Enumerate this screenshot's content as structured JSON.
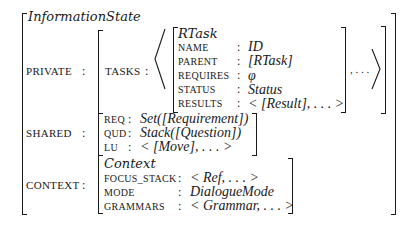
{
  "diagram": {
    "title": "InformationState",
    "private": {
      "label": "PRIVATE",
      "colon": ":",
      "tasks": {
        "label": "TASKS",
        "colon": ":",
        "rtask": {
          "type": "RTask",
          "fields": [
            {
              "label": "NAME",
              "colon": ":",
              "value": "ID"
            },
            {
              "label": "PARENT",
              "colon": ":",
              "value": "[RTask]"
            },
            {
              "label": "REQUIRES",
              "colon": ":",
              "value": "φ"
            },
            {
              "label": "STATUS",
              "colon": ":",
              "value": "Status"
            },
            {
              "label": "RESULTS",
              "colon": ":",
              "value": "< [Result], . . . >"
            }
          ]
        },
        "ellipsis": ", . . ."
      }
    },
    "shared": {
      "label": "SHARED",
      "colon": ":",
      "fields": [
        {
          "label": "REQ",
          "colon": ":",
          "value": "Set([Requirement])"
        },
        {
          "label": "QUD",
          "colon": ":",
          "value": "Stack([Question])"
        },
        {
          "label": "LU",
          "colon": ":",
          "value": "< [Move], . . . >"
        }
      ]
    },
    "context": {
      "label": "CONTEXT",
      "colon": ":",
      "type": "Context",
      "fields": [
        {
          "label": "FOCUS_STACK",
          "colon": ":",
          "value": "< Ref, . . . >"
        },
        {
          "label": "MODE",
          "colon": ":",
          "value": "DialogueMode"
        },
        {
          "label": "GRAMMARS",
          "colon": ":",
          "value": "< Grammar, . . . >"
        }
      ]
    }
  }
}
